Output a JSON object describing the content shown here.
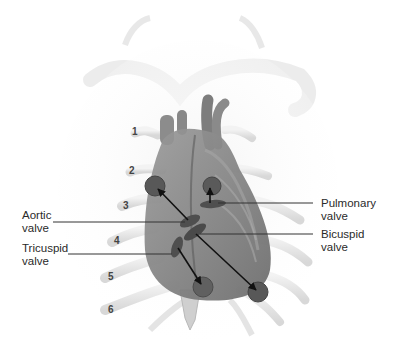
{
  "figure": {
    "colors": {
      "background": "#ffffff",
      "heart": "#7a7a7a",
      "heart_dark": "#5a5a5a",
      "valve": "#4a4a4a",
      "auscultation_circle": "#555555",
      "rib": "#e8e8e8",
      "leader_line": "#333333",
      "text": "#2a2a2a"
    }
  },
  "labels": {
    "aortic": {
      "line1": "Aortic",
      "line2": "valve"
    },
    "tricuspid": {
      "line1": "Tricuspid",
      "line2": "valve"
    },
    "pulmonary": {
      "line1": "Pulmonary",
      "line2": "valve"
    },
    "bicuspid": {
      "line1": "Bicuspid",
      "line2": "valve"
    }
  },
  "rib_numbers": [
    "1",
    "2",
    "3",
    "4",
    "5",
    "6"
  ]
}
